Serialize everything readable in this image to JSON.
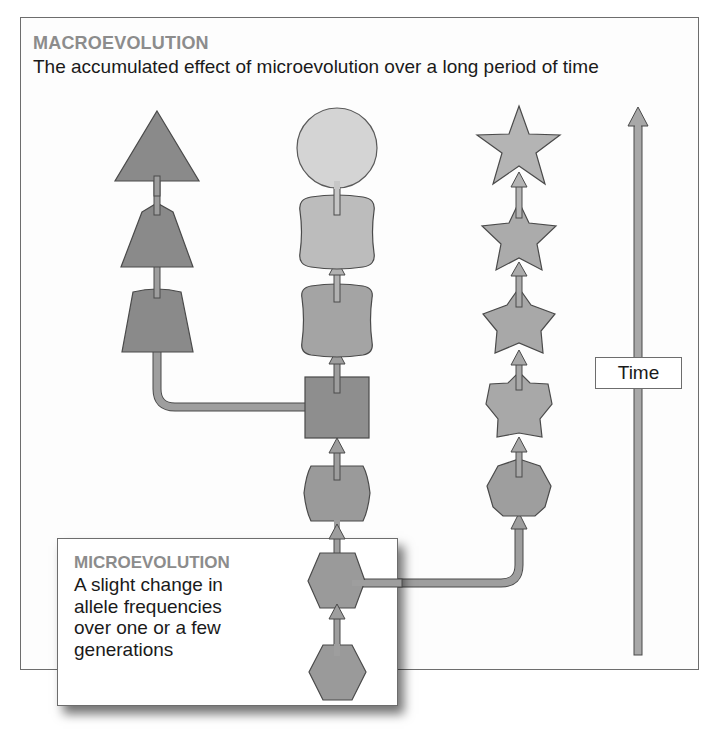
{
  "macroevolution": {
    "title": "MACROEVOLUTION",
    "description": "The accumulated effect of microevolution over a long period of time"
  },
  "microevolution": {
    "title": "MICROEVOLUTION",
    "description": "A slight change in allele frequencies over one or a few generations"
  },
  "time_axis": {
    "label": "Time",
    "direction": "up"
  },
  "colors": {
    "shape_dark": "#8a8a8a",
    "shape_mid": "#9e9e9e",
    "shape_light": "#b8b8b8",
    "shape_lightest": "#d2d2d2",
    "outline": "#4a4a4a",
    "title_gray": "#8c8c8c",
    "text": "#1a1a1a",
    "frame": "#6d6d6d"
  },
  "lineages": [
    {
      "name": "left-lineage",
      "stages": [
        "trapezoid",
        "trapezoid",
        "triangle"
      ],
      "branches_from": "square"
    },
    {
      "name": "middle-lineage",
      "stages": [
        "hexagon",
        "hexagon",
        "rounded-hexagon",
        "square",
        "rounded-square",
        "rounded-square",
        "circle"
      ]
    },
    {
      "name": "right-lineage",
      "stages": [
        "heptagon",
        "pentagon-star",
        "star",
        "star",
        "star"
      ],
      "branches_from": "hexagon"
    }
  ]
}
